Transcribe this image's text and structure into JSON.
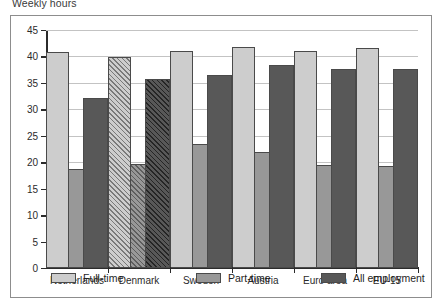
{
  "title": "Weekly hours",
  "chart_data": {
    "type": "bar",
    "title": "Weekly hours",
    "xlabel": "",
    "ylabel": "",
    "ylim": [
      0,
      45
    ],
    "yticks": [
      "0",
      "5",
      "10",
      "15",
      "20",
      "25",
      "30",
      "35",
      "40",
      "45"
    ],
    "grid": true,
    "legend_position": "bottom",
    "categories": [
      "Netherlands",
      "Denmark",
      "Sweden",
      "Austria",
      "Euro area",
      "EU-15"
    ],
    "series": [
      {
        "name": "Full-time",
        "color": "#cdcdcd",
        "values": [
          40.9,
          39.9,
          41.1,
          41.7,
          41.0,
          41.6
        ]
      },
      {
        "name": "Part-time",
        "color": "#989898",
        "values": [
          18.7,
          19.6,
          23.4,
          21.9,
          19.5,
          19.2
        ]
      },
      {
        "name": "All employment",
        "color": "#585858",
        "values": [
          32.2,
          35.7,
          36.5,
          38.4,
          37.7,
          37.6
        ]
      }
    ],
    "hatched_categories": [
      "Denmark"
    ]
  },
  "legend": {
    "items": [
      {
        "label": "Full-time"
      },
      {
        "label": "Part-time"
      },
      {
        "label": "All employment"
      }
    ]
  }
}
